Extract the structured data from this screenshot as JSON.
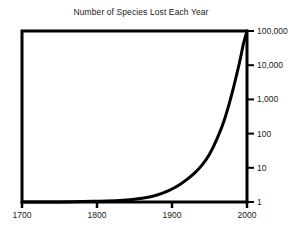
{
  "chart_data": {
    "type": "line",
    "title": "Number of Species Lost Each Year",
    "xlabel": "",
    "ylabel": "",
    "xlim": [
      1700,
      2000
    ],
    "ylim": [
      1,
      100000
    ],
    "yscale": "log",
    "xscale": "linear",
    "grid": false,
    "legend": null,
    "line_color": "#000000",
    "background_color": "#ffffff",
    "xticks": [
      1700,
      1800,
      1900,
      2000
    ],
    "xticklabels": [
      "1700",
      "1800",
      "1900",
      "2000"
    ],
    "yticks": [
      1,
      10,
      100,
      1000,
      10000,
      100000
    ],
    "yticklabels": [
      "1",
      "10",
      "100",
      "1,000",
      "10,000",
      "100,000"
    ],
    "series": [
      {
        "name": "Species lost per year",
        "x": [
          1700,
          1750,
          1800,
          1830,
          1850,
          1870,
          1880,
          1890,
          1900,
          1910,
          1920,
          1930,
          1940,
          1950,
          1960,
          1970,
          1980,
          1990,
          1995,
          2000
        ],
        "values": [
          1,
          1,
          1.05,
          1.1,
          1.2,
          1.4,
          1.6,
          1.9,
          2.4,
          3.2,
          4.6,
          7,
          12,
          25,
          70,
          260,
          1500,
          12000,
          40000,
          100000
        ]
      }
    ]
  },
  "axes": {
    "y_tick_labels": [
      "100,000",
      "10,000",
      "1,000",
      "100",
      "10",
      "1"
    ],
    "x_tick_labels": [
      "1700",
      "1800",
      "1900",
      "2000"
    ]
  }
}
